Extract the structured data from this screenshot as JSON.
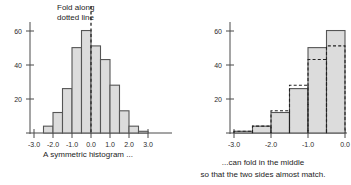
{
  "annotation": {
    "line1": "Fold along",
    "line2": "dotted line"
  },
  "captions": {
    "left": "A symmetric histogram ...",
    "right_line1": "...can fold in the middle",
    "right_line2": "so that the two sides almost match."
  },
  "colors": {
    "bar_fill": "#dcdcdc",
    "bar_stroke": "#555555",
    "dash_stroke": "#222222",
    "axis": "#4a4a4a",
    "text": "#1c1c1c",
    "background": "#ffffff"
  },
  "chart_data": [
    {
      "type": "bar",
      "id": "symmetric-histogram",
      "title": "A symmetric histogram ...",
      "xlabel": "",
      "ylabel": "",
      "grid": false,
      "legend": "none",
      "xlim": [
        -3.5,
        3.5
      ],
      "ylim": [
        0,
        65
      ],
      "xticks": [
        -3.0,
        -2.0,
        -1.0,
        0.0,
        1.0,
        2.0,
        3.0
      ],
      "xticklabels": [
        "-3.0",
        "-2.0",
        "-1.0",
        "0.0",
        "1.0",
        "2.0",
        "3.0"
      ],
      "yticks": [
        20,
        40,
        60
      ],
      "yticklabels": [
        "20",
        "40",
        "60"
      ],
      "bin_edges": [
        -2.5,
        -2.0,
        -1.5,
        -1.0,
        -0.5,
        0.0,
        0.5,
        1.0,
        1.5,
        2.0,
        2.5,
        3.0
      ],
      "categories": [
        "-2.5 to -2.0",
        "-2.0 to -1.5",
        "-1.5 to -1.0",
        "-1.0 to -0.5",
        "-0.5 to 0.0",
        "0.0 to 0.5",
        "0.5 to 1.0",
        "1.0 to 1.5",
        "1.5 to 2.0",
        "2.0 to 2.5",
        "2.5 to 3.0"
      ],
      "values": [
        4,
        12,
        26,
        50,
        60,
        51,
        43,
        28,
        13,
        4,
        1
      ],
      "annotations": [
        {
          "text": "Fold along dotted line",
          "x": 0.0,
          "type": "fold-line-label"
        }
      ],
      "fold_line_x": 0.0
    },
    {
      "type": "bar",
      "id": "folded-histogram",
      "title": "...can fold in the middle",
      "subtitle": "so that the two sides almost match.",
      "xlabel": "",
      "ylabel": "",
      "grid": false,
      "legend": "none",
      "xlim": [
        -3.5,
        0.5
      ],
      "ylim": [
        0,
        65
      ],
      "xticks": [
        -3.0,
        -2.0,
        -1.0,
        0.0
      ],
      "xticklabels": [
        "-3.0",
        "-2.0",
        "-1.0",
        "0.0"
      ],
      "yticks": [
        20,
        40,
        60
      ],
      "yticklabels": [
        "20",
        "40",
        "60"
      ],
      "bin_edges": [
        -3.0,
        -2.5,
        -2.0,
        -1.5,
        -1.0,
        -0.5,
        0.0
      ],
      "categories": [
        "-3.0 to -2.5",
        "-2.5 to -2.0",
        "-2.0 to -1.5",
        "-1.5 to -1.0",
        "-1.0 to -0.5",
        "-0.5 to 0.0"
      ],
      "series": [
        {
          "name": "left half (solid)",
          "style": "solid-gray",
          "values": [
            0,
            1,
            4,
            12,
            26,
            50,
            60
          ]
        },
        {
          "name": "right half folded over (dashed)",
          "style": "dashed-outline",
          "values": [
            1,
            4,
            13,
            28,
            43,
            51
          ]
        }
      ],
      "values": [
        1,
        4,
        12,
        26,
        50,
        60
      ],
      "dashed_values": [
        1,
        4,
        13,
        28,
        43,
        51
      ]
    }
  ]
}
